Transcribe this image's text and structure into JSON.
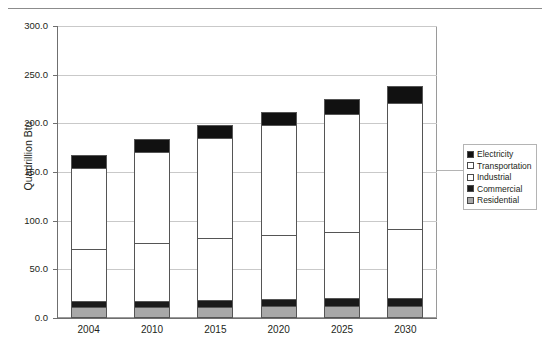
{
  "figure": {
    "cropped_caption": "",
    "y_axis_title": "Quadrillion Btu"
  },
  "legend": {
    "position": "right",
    "items": [
      {
        "label": "Electricity",
        "swatch": "black",
        "color": "#111111"
      },
      {
        "label": "Transportation",
        "swatch": "white",
        "color": "#ffffff"
      },
      {
        "label": "Industrial",
        "swatch": "white",
        "color": "#ffffff"
      },
      {
        "label": "Commercial",
        "swatch": "black",
        "color": "#1a1a1a"
      },
      {
        "label": "Residential",
        "swatch": "gray",
        "color": "#a8a8a8"
      }
    ]
  },
  "chart_data": {
    "type": "bar",
    "stacked": true,
    "title": "",
    "xlabel": "",
    "ylabel": "Quadrillion Btu",
    "categories": [
      "2004",
      "2010",
      "2015",
      "2020",
      "2025",
      "2030"
    ],
    "ylim": [
      0.0,
      300.0
    ],
    "ytick_labels": [
      "0.0",
      "50.0",
      "100.0",
      "150.0",
      "200.0",
      "250.0",
      "300.0"
    ],
    "ytick_values": [
      0.0,
      50.0,
      100.0,
      150.0,
      200.0,
      250.0,
      300.0
    ],
    "grid": true,
    "series": [
      {
        "name": "Residential",
        "color": "#a8a8a8",
        "values": [
          11.0,
          11.3,
          11.6,
          11.9,
          12.2,
          12.5
        ]
      },
      {
        "name": "Commercial",
        "color": "#1a1a1a",
        "values": [
          6.0,
          6.6,
          7.1,
          7.6,
          8.0,
          8.4
        ]
      },
      {
        "name": "Industrial",
        "color": "#ffffff",
        "values": [
          54.0,
          59.6,
          63.8,
          66.0,
          68.3,
          70.6
        ]
      },
      {
        "name": "Transportation",
        "color": "#ffffff",
        "values": [
          83.0,
          93.0,
          102.0,
          113.0,
          121.0,
          129.0
        ]
      },
      {
        "name": "Electricity",
        "color": "#111111",
        "values": [
          13.0,
          13.5,
          13.5,
          13.5,
          15.0,
          18.0
        ]
      }
    ],
    "totals": [
      167.0,
      184.0,
      198.0,
      212.0,
      224.5,
      238.5
    ]
  }
}
